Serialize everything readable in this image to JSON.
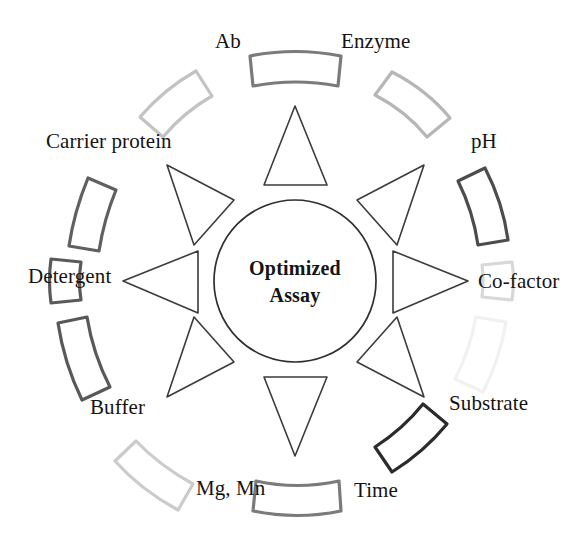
{
  "diagram": {
    "type": "radial-hub-and-spoke",
    "background_color": "#ffffff",
    "hub": {
      "label_line1": "Optimized",
      "label_line2": "Assay",
      "center_x": 295,
      "center_y": 281,
      "radius": 81,
      "stroke_color": "#2f2f2f",
      "fill_color": "#ffffff"
    },
    "spoke_count": 8,
    "spoke_stroke_color": "#3b3b3b",
    "segments": [
      {
        "id": "enzyme",
        "label": "Enzyme",
        "angle_deg": -67,
        "block_stroke_color": "#b6b6b6",
        "label_x": 341,
        "label_y": 48,
        "label_anchor": "start"
      },
      {
        "id": "ph",
        "label": "pH",
        "angle_deg": -22,
        "block_stroke_color": "#4c4c4c",
        "label_x": 471,
        "label_y": 148,
        "label_anchor": "start"
      },
      {
        "id": "co-factor",
        "label": "Co-factor",
        "angle_deg": 0,
        "block_stroke_color": "#d8d8d8",
        "label_x": 478,
        "label_y": 288,
        "label_anchor": "start"
      },
      {
        "id": "substrate",
        "label": "Substrate",
        "angle_deg": 22,
        "block_stroke_color": "#f1f1f1",
        "label_x": 449,
        "label_y": 410,
        "label_anchor": "start"
      },
      {
        "id": "time",
        "label": "Time",
        "angle_deg": 67,
        "block_stroke_color": "#2b2b2b",
        "label_x": 354,
        "label_y": 497,
        "label_anchor": "start"
      },
      {
        "id": "mg-mn",
        "label": "Mg, Mn",
        "angle_deg": 113,
        "block_stroke_color": "#cbcbcb",
        "label_x": 196,
        "label_y": 495,
        "label_anchor": "start"
      },
      {
        "id": "buffer",
        "label": "Buffer",
        "angle_deg": 158,
        "block_stroke_color": "#595959",
        "label_x": 90,
        "label_y": 414,
        "label_anchor": "start"
      },
      {
        "id": "detergent",
        "label": "Detergent",
        "angle_deg": 180,
        "block_stroke_color": "#5a5a5a",
        "label_x": 28,
        "label_y": 283,
        "label_anchor": "start"
      },
      {
        "id": "carrier-protein",
        "label": "Carrier protein",
        "angle_deg": 202,
        "block_stroke_color": "#606060",
        "label_x": 46,
        "label_y": 148,
        "label_anchor": "start"
      },
      {
        "id": "ab",
        "label": "Ab",
        "angle_deg": 247,
        "block_stroke_color": "#c3c3c3",
        "label_x": 215,
        "label_y": 48,
        "label_anchor": "start"
      },
      {
        "id": "ring-top",
        "label": "",
        "angle_deg": 270,
        "block_stroke_color": "#7b7b7b",
        "label_x": 0,
        "label_y": 0,
        "label_anchor": "middle"
      },
      {
        "id": "ring-bottom",
        "label": "",
        "angle_deg": 90,
        "block_stroke_color": "#7b7b7b",
        "label_x": 0,
        "label_y": 0,
        "label_anchor": "middle"
      }
    ]
  }
}
